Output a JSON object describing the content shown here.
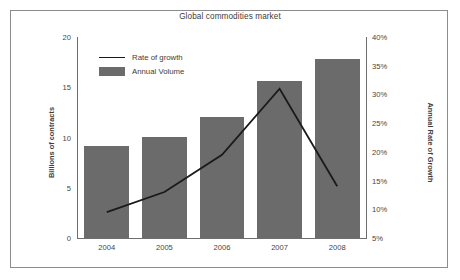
{
  "chart_data": {
    "type": "bar",
    "title": "Global commodities market",
    "categories": [
      "2004",
      "2005",
      "2006",
      "2007",
      "2008"
    ],
    "xlabel": "",
    "ylabel": "Billions of contracts",
    "ylabel_secondary": "Annual Rate of Growth",
    "ylim": [
      0,
      20
    ],
    "ylim_secondary": [
      5,
      40
    ],
    "yticks": [
      "0",
      "5",
      "10",
      "15",
      "20"
    ],
    "ytick_values": [
      0,
      5,
      10,
      15,
      20
    ],
    "yticks_secondary": [
      "5%",
      "10%",
      "15%",
      "20%",
      "25%",
      "30%",
      "35%",
      "40%"
    ],
    "ytick_values_secondary": [
      5,
      10,
      15,
      20,
      25,
      30,
      35,
      40
    ],
    "grid": false,
    "legend_position": "upper left inside",
    "series": [
      {
        "name": "Annual Volume",
        "type": "bar",
        "axis": "left",
        "color": "#6b6b6b",
        "values": [
          9.2,
          10.1,
          12.0,
          15.6,
          17.8
        ]
      },
      {
        "name": "Rate of growth",
        "type": "line",
        "axis": "right",
        "color": "#1a1a1a",
        "values": [
          9.5,
          13.0,
          19.5,
          31.0,
          14.0
        ]
      }
    ]
  },
  "legend": {
    "items": [
      {
        "label": "Rate of growth",
        "marker": "line"
      },
      {
        "label": "Annual Volume",
        "marker": "box"
      }
    ]
  },
  "colors": {
    "bar": "#6b6b6b",
    "line": "#1a1a1a",
    "axis": "#6e6e6e",
    "border": "#8c8c8c",
    "text": "#3d3d3d",
    "background": "#ffffff"
  }
}
